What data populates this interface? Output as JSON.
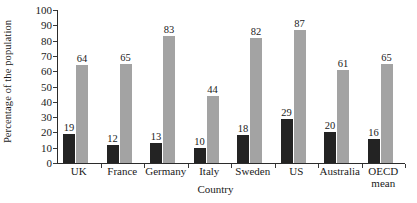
{
  "chart_data": {
    "type": "bar",
    "title": "",
    "subtitle": "",
    "xlabel": "Country",
    "ylabel": "Percentage of the population",
    "categories": [
      "UK",
      "France",
      "Germany",
      "Italy",
      "Sweden",
      "US",
      "Australia",
      "OECD\nmean"
    ],
    "series": [
      {
        "name": "dark",
        "color": "#232323",
        "values": [
          19,
          12,
          13,
          10,
          18,
          29,
          20,
          16
        ]
      },
      {
        "name": "grey",
        "color": "#a3a3a3",
        "values": [
          64,
          65,
          83,
          44,
          82,
          87,
          61,
          65
        ]
      }
    ],
    "ylim": [
      0,
      100
    ],
    "ytick_step": 10,
    "yticks": [
      0,
      10,
      20,
      30,
      40,
      50,
      60,
      70,
      80,
      90,
      100
    ],
    "ytick_labels": [
      "0",
      "10",
      "20",
      "30",
      "40",
      "50",
      "60",
      "70",
      "80",
      "90",
      "100"
    ],
    "grid": false,
    "legend": "none",
    "data_labels": true,
    "background_color": "#ffffff",
    "axis_color": "#2b2b2b"
  }
}
